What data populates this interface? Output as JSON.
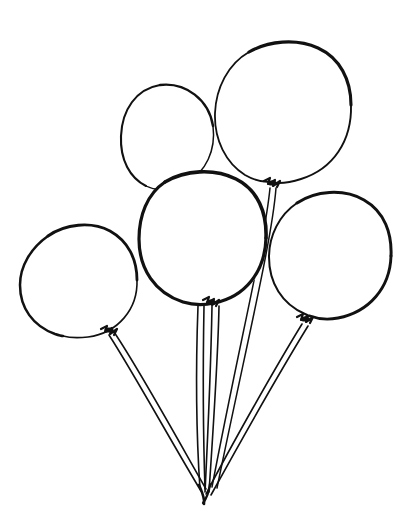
{
  "artwork": {
    "title": "Balloon Bunch",
    "subject": "five party balloons tied together",
    "style": "hand-drawn black ink line art, coloring-book outline",
    "width": 417,
    "height": 531,
    "background_color": "#ffffff",
    "ink_color": "#111111",
    "balloon_count": 5,
    "string_convergence": {
      "x": 205,
      "y": 492
    }
  },
  "balloons": [
    {
      "id": "balloon-top-right",
      "label": "Top right balloon",
      "size": "large",
      "center": {
        "x": 283,
        "y": 112
      },
      "radius_x": 68,
      "radius_y": 72,
      "knot": {
        "x": 272,
        "y": 183
      },
      "depth": "back",
      "outline_weight": 3.0
    },
    {
      "id": "balloon-upper-middle",
      "label": "Upper middle balloon",
      "size": "small",
      "center": {
        "x": 168,
        "y": 135
      },
      "radius_x": 46,
      "radius_y": 51,
      "knot": null,
      "depth": "back",
      "outline_weight": 2.2,
      "occluded_by": "balloon-center"
    },
    {
      "id": "balloon-center",
      "label": "Center balloon",
      "size": "large",
      "center": {
        "x": 203,
        "y": 238
      },
      "radius_x": 63,
      "radius_y": 67,
      "knot": {
        "x": 211,
        "y": 301
      },
      "depth": "front",
      "outline_weight": 3.4
    },
    {
      "id": "balloon-left",
      "label": "Left balloon",
      "size": "medium",
      "center": {
        "x": 78,
        "y": 281
      },
      "radius_x": 59,
      "radius_y": 58,
      "knot": {
        "x": 109,
        "y": 329
      },
      "depth": "front",
      "outline_weight": 2.6
    },
    {
      "id": "balloon-right",
      "label": "Right balloon",
      "size": "large",
      "center": {
        "x": 330,
        "y": 254
      },
      "radius_x": 61,
      "radius_y": 64,
      "knot": {
        "x": 305,
        "y": 318
      },
      "depth": "front",
      "outline_weight": 2.9
    }
  ],
  "strings": [
    {
      "id": "string-left",
      "from_balloon": "balloon-left",
      "start": {
        "x": 109,
        "y": 333
      },
      "end": {
        "x": 203,
        "y": 491
      }
    },
    {
      "id": "string-center-a",
      "from_balloon": "balloon-center",
      "start": {
        "x": 200,
        "y": 305
      },
      "end": {
        "x": 200,
        "y": 489
      }
    },
    {
      "id": "string-center-b",
      "from_balloon": "balloon-center",
      "start": {
        "x": 215,
        "y": 305
      },
      "end": {
        "x": 206,
        "y": 494
      }
    },
    {
      "id": "string-top-right",
      "from_balloon": "balloon-top-right",
      "start": {
        "x": 273,
        "y": 188
      },
      "end": {
        "x": 210,
        "y": 487
      }
    },
    {
      "id": "string-right",
      "from_balloon": "balloon-right",
      "start": {
        "x": 303,
        "y": 323
      },
      "end": {
        "x": 207,
        "y": 495
      }
    }
  ],
  "chart_data": {
    "type": "scatter",
    "title": "Balloon Bunch",
    "xlabel": "",
    "ylabel": "",
    "xlim": [
      0,
      417
    ],
    "ylim": [
      0,
      531
    ],
    "grid": false,
    "legend": "none",
    "categories": [
      "balloon-left",
      "balloon-upper-middle",
      "balloon-center",
      "balloon-top-right",
      "balloon-right"
    ],
    "series": [
      {
        "name": "center_x",
        "values": [
          78,
          168,
          203,
          283,
          330
        ]
      },
      {
        "name": "center_y",
        "values": [
          281,
          135,
          238,
          112,
          254
        ]
      },
      {
        "name": "radius",
        "values": [
          58,
          48,
          65,
          70,
          62
        ]
      }
    ],
    "annotations": [
      "five balloons drawn as overlapping circles",
      "strings converge to a single knot near (205, 492)"
    ]
  }
}
